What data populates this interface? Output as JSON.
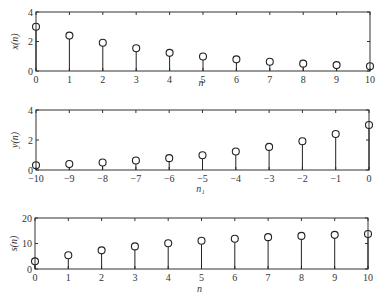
{
  "chart_data": [
    {
      "type": "stem",
      "ylabel": "x(n)",
      "xlabel": "n",
      "x": [
        0,
        1,
        2,
        3,
        4,
        5,
        6,
        7,
        8,
        9,
        10
      ],
      "values": [
        3.0,
        2.4,
        1.92,
        1.54,
        1.23,
        0.98,
        0.79,
        0.63,
        0.5,
        0.4,
        0.32
      ],
      "xlim": [
        0,
        10
      ],
      "ylim": [
        0,
        4
      ],
      "xticks": [
        0,
        1,
        2,
        3,
        4,
        5,
        6,
        7,
        8,
        9,
        10
      ],
      "yticks": [
        0,
        2,
        4
      ],
      "grid": false
    },
    {
      "type": "stem",
      "ylabel": "y(n)",
      "xlabel": "n₁",
      "x": [
        -10,
        -9,
        -8,
        -7,
        -6,
        -5,
        -4,
        -3,
        -2,
        -1,
        0
      ],
      "values": [
        0.32,
        0.4,
        0.5,
        0.63,
        0.79,
        0.98,
        1.23,
        1.54,
        1.92,
        2.4,
        3.0
      ],
      "xlim": [
        -10,
        0
      ],
      "ylim": [
        0,
        4
      ],
      "xticks": [
        -10,
        -9,
        -8,
        -7,
        -6,
        -5,
        -4,
        -3,
        -2,
        -1,
        0
      ],
      "yticks": [
        0,
        2,
        4
      ],
      "grid": false
    },
    {
      "type": "stem",
      "ylabel": "s(n)",
      "xlabel": "n",
      "x": [
        0,
        1,
        2,
        3,
        4,
        5,
        6,
        7,
        8,
        9,
        10
      ],
      "values": [
        3.0,
        5.4,
        7.32,
        8.86,
        10.09,
        11.07,
        11.86,
        12.49,
        12.99,
        13.39,
        13.71
      ],
      "xlim": [
        0,
        10
      ],
      "ylim": [
        0,
        20
      ],
      "xticks": [
        0,
        1,
        2,
        3,
        4,
        5,
        6,
        7,
        8,
        9,
        10
      ],
      "yticks": [
        0,
        10,
        20
      ],
      "grid": false
    }
  ],
  "layout": {
    "plots": [
      {
        "left": 36,
        "right": 370,
        "top": 12,
        "bottom": 71,
        "xlabel_y": 86
      },
      {
        "left": 36,
        "right": 369,
        "top": 110,
        "bottom": 170,
        "xlabel_y": 192
      },
      {
        "left": 35,
        "right": 368,
        "top": 218,
        "bottom": 269,
        "xlabel_y": 292
      }
    ]
  }
}
